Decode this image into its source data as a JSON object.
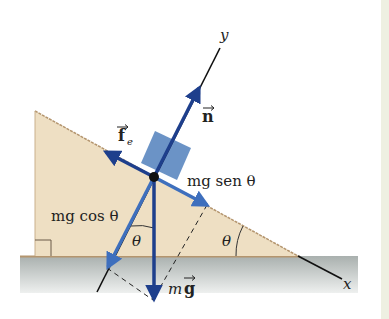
{
  "diagram": {
    "axes": {
      "x_label": "x",
      "y_label": "y"
    },
    "forces": {
      "normal": {
        "label": "n",
        "has_vector_arrow": true
      },
      "friction": {
        "label": "f",
        "subscript": "e",
        "has_vector_arrow": true
      },
      "weight": {
        "label_m": "m",
        "label_g": "g",
        "has_vector_arrow": true
      },
      "parallel_component": {
        "label": "mg sen θ"
      },
      "perpendicular_component": {
        "label": "mg cos θ"
      }
    },
    "angles": {
      "incline_angle": "θ",
      "component_angle": "θ"
    },
    "colors": {
      "incline_fill": "#eedfc3",
      "incline_edge": "#b4956e",
      "ground_top": "#a9b0ae",
      "ground_bottom": "#e6e9e8",
      "block": "#5b87c0",
      "force_dark": "#1e3f8c",
      "force_light": "#3e6fbd",
      "axis": "#111111"
    }
  }
}
